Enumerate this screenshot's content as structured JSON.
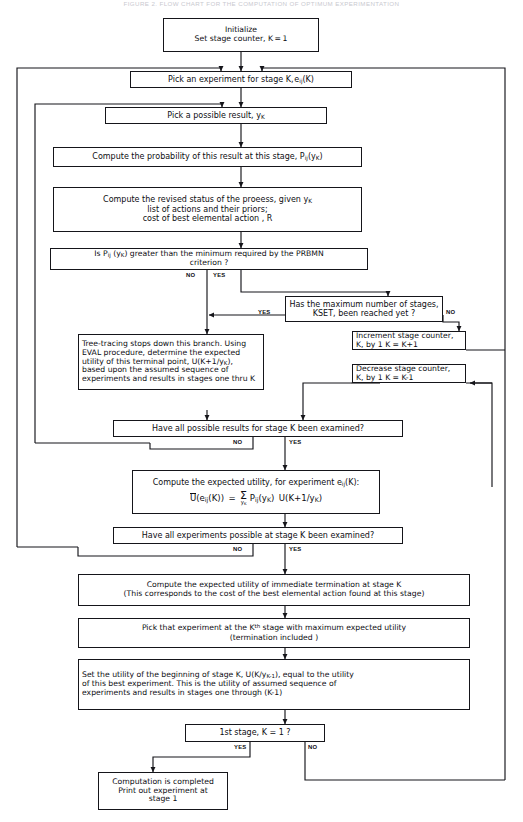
{
  "figure": {
    "caption": "FIGURE 2. FLOW CHART FOR THE COMPUTATION OF OPTIMUM EXPERIMENTATION",
    "width": 523,
    "height": 822,
    "ink_color": "#15151a",
    "background": "#ffffff"
  },
  "nodes": {
    "initialize": {
      "lines": [
        "Initialize",
        "Set stage counter, K = 1"
      ]
    },
    "pick_experiment": {
      "lines": [
        "Pick an experiment for stage K, e_ij(K)"
      ]
    },
    "pick_result": {
      "lines": [
        "Pick a possible result, y_K"
      ]
    },
    "compute_probability": {
      "lines": [
        "Compute the probability of this result at this stage, P_ij(y_K)"
      ]
    },
    "compute_revised_status": {
      "lines": [
        "Compute the revised status of the proeess, given y_K",
        "list of actions and their priors;",
        "cost of best elemental action , R"
      ]
    },
    "prbmn_test": {
      "lines": [
        "Is Pij (y_K) greater than the minimum required by the PRBMN",
        "criterion ?"
      ]
    },
    "kset_test": {
      "lines": [
        "Has the maximum number of stages,",
        "KSET, been reached yet ?"
      ]
    },
    "increment_counter": {
      "lines": [
        "Increment stage counter,",
        "K, by 1        K = K+1"
      ]
    },
    "decrease_counter": {
      "lines": [
        "Decrease stage counter,",
        "K, by 1        K = K-1"
      ]
    },
    "tree_tracing": {
      "lines": [
        "Tree-tracing stops down this branch. Using",
        "EVAL procedure, determine the expected",
        "utility of this terminal point, U(K+1/y_K),",
        "based upon the assumed sequence of",
        "experiments and results in stages one thru K"
      ]
    },
    "results_examined_test": {
      "lines": [
        "Have all possible results for stage K been examined?"
      ]
    },
    "compute_expected_utility": {
      "lines": [
        "Compute the expected utility, for experiment e_ij(K):"
      ],
      "formula": {
        "lhs": "U(e_ij(K))",
        "eq": "=",
        "sum_over": "y_K",
        "rhs": "P_ij(y_K)  U(K+1/y_K)"
      }
    },
    "experiments_examined_test": {
      "lines": [
        "Have all experiments possible at stage K been examined?"
      ]
    },
    "immediate_termination": {
      "lines": [
        "Compute the expected utility of immediate termination at stage K",
        "(This corresponds to the cost of the best elemental action found at this stage)"
      ]
    },
    "pick_max_utility": {
      "lines": [
        "Pick that experiment at the K th stage with maximum expected utility",
        "(termination included )"
      ]
    },
    "set_utility": {
      "lines": [
        "Set the utility of the beginning of stage K, U(K/y_K-1), equal to the utility",
        "of this best experiment. This is the utility of assumed sequence of",
        "experiments and results in stages one through (K-1)"
      ]
    },
    "first_stage_test": {
      "lines": [
        "1st stage, K = 1 ?"
      ]
    },
    "computation_complete": {
      "lines": [
        "Computation is completed",
        "Print out experiment at",
        "stage 1"
      ]
    }
  },
  "edge_labels": {
    "prbmn_no": "NO",
    "prbmn_yes": "YES",
    "kset_yes": "YES",
    "kset_no": "NO",
    "results_no": "NO",
    "results_yes": "YES",
    "experiments_no": "NO",
    "experiments_yes": "YES",
    "first_stage_yes": "YES",
    "first_stage_no": "NO"
  }
}
